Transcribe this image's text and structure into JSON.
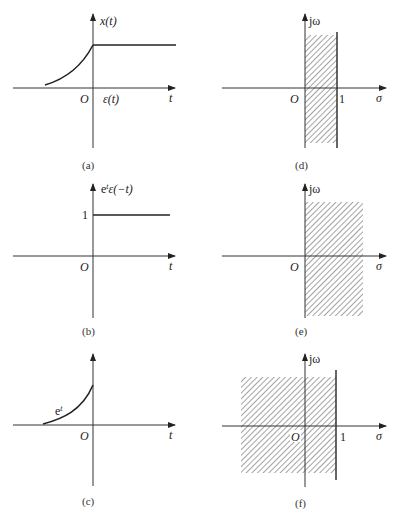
{
  "figure": {
    "panels": [
      {
        "id": "a",
        "caption": "(a)",
        "type": "time-signal",
        "y_label": "x(t)",
        "x_label": "t",
        "origin_label": "O",
        "annotation": "ε(t)"
      },
      {
        "id": "b",
        "caption": "(b)",
        "type": "time-signal",
        "y_label": "e^t ε(−t)",
        "y_label_base": "e",
        "y_label_sup": "t",
        "y_label_rest": "ε(−t)",
        "x_label": "t",
        "origin_label": "O",
        "level_label": "1"
      },
      {
        "id": "c",
        "caption": "(c)",
        "type": "time-signal",
        "x_label": "t",
        "origin_label": "O",
        "curve_label_base": "e",
        "curve_label_sup": "t"
      },
      {
        "id": "d",
        "caption": "(d)",
        "type": "s-plane-roc",
        "y_label": "jω",
        "x_label": "σ",
        "origin_label": "O",
        "boundary_label": "1",
        "roc": "0 < σ < 1"
      },
      {
        "id": "e",
        "caption": "(e)",
        "type": "s-plane-roc",
        "y_label": "jω",
        "x_label": "σ",
        "origin_label": "O",
        "roc": "σ > 0"
      },
      {
        "id": "f",
        "caption": "(f)",
        "type": "s-plane-roc",
        "y_label": "jω",
        "x_label": "σ",
        "origin_label": "O",
        "boundary_label": "1",
        "roc": "σ < 1"
      }
    ]
  }
}
